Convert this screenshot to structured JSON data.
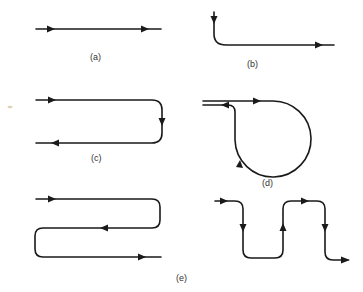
{
  "figure": {
    "colors": {
      "stroke": "#1a1a1a",
      "background": "#ffffff"
    },
    "panels": [
      {
        "id": "a",
        "label": "(a)",
        "description": "Straight line with two right-pointing arrows"
      },
      {
        "id": "b",
        "label": "(b)",
        "description": "Downward line curving into a rightward line"
      },
      {
        "id": "c",
        "label": "(c)",
        "description": "U-shaped path: right, down, left"
      },
      {
        "id": "d",
        "label": "(d)",
        "description": "Loop path: right, around circle, back left"
      },
      {
        "id": "e",
        "label": "(e)",
        "description": "Serpentine paths: horizontal zigzag (left) and vertical meander (right)"
      }
    ]
  }
}
